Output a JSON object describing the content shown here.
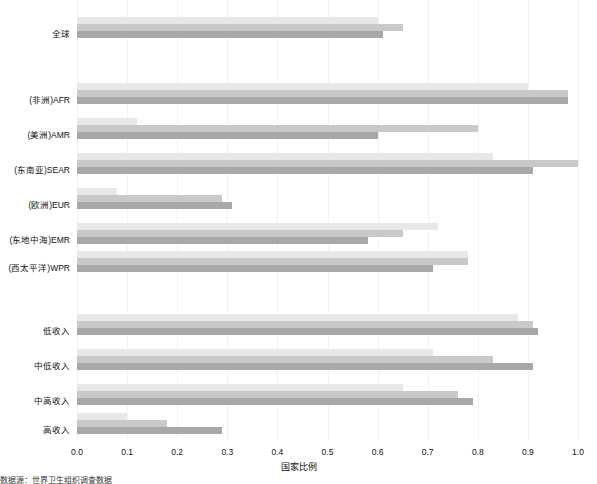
{
  "chart_data": {
    "type": "bar",
    "orientation": "horizontal",
    "title": "",
    "xlabel": "国家比例",
    "ylabel": "",
    "xlim": [
      0.0,
      1.0
    ],
    "grid": "vertical-light",
    "legend_position": "none",
    "xticks": [
      "0.0",
      "0.1",
      "0.2",
      "0.3",
      "0.4",
      "0.5",
      "0.6",
      "0.7",
      "0.8",
      "0.9",
      "1.0"
    ],
    "xtickvalues": [
      0.0,
      0.1,
      0.2,
      0.3,
      0.4,
      0.5,
      0.6,
      0.7,
      0.8,
      0.9,
      1.0
    ],
    "categories": [
      "全球",
      "(非洲)AFR",
      "(美洲)AMR",
      "(东南亚)SEAR",
      "(欧洲)EUR",
      "(东地中海)EMR",
      "(西太平洋)WPR",
      "低收入",
      "中低收入",
      "中高收入",
      "高收入"
    ],
    "series": [
      {
        "name": "series-1",
        "color": "#e8e8e8",
        "values": [
          0.6,
          0.9,
          0.12,
          0.83,
          0.08,
          0.72,
          0.78,
          0.88,
          0.71,
          0.65,
          0.1
        ]
      },
      {
        "name": "series-2",
        "color": "#c9c9c9",
        "values": [
          0.65,
          0.98,
          0.8,
          1.0,
          0.29,
          0.65,
          0.78,
          0.91,
          0.83,
          0.76,
          0.18
        ]
      },
      {
        "name": "series-3",
        "color": "#a8a8a8",
        "values": [
          0.61,
          0.98,
          0.6,
          0.91,
          0.31,
          0.58,
          0.71,
          0.92,
          0.91,
          0.79,
          0.29
        ]
      }
    ],
    "footnote": "数据源：世界卫生组织调查数据"
  },
  "axis": {
    "x_title": "国家比例"
  }
}
